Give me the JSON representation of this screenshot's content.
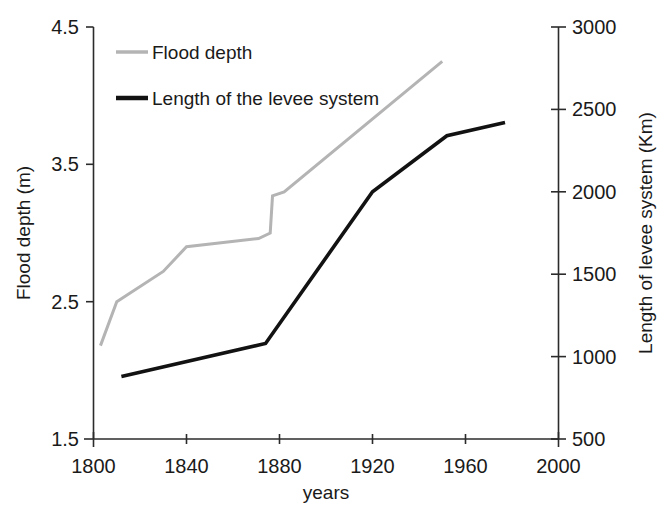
{
  "chart_data": {
    "type": "line",
    "title": "",
    "subtitle": "",
    "xlabel": "years",
    "ylabel": "Flood depth (m)",
    "y2label": "Length of levee system (Km)",
    "grid": false,
    "legend_position": "top-left inside plot",
    "xlim": [
      1800,
      2000
    ],
    "ylim": [
      1.5,
      4.5
    ],
    "y2lim": [
      500,
      3000
    ],
    "xticks": [
      "1800",
      "1840",
      "1880",
      "1920",
      "1960",
      "2000"
    ],
    "xtick_values": [
      1800,
      1840,
      1880,
      1920,
      1960,
      2000
    ],
    "yticks": [
      "1.5",
      "2.5",
      "3.5",
      "4.5"
    ],
    "ytick_values": [
      1.5,
      2.5,
      3.5,
      4.5
    ],
    "y2ticks": [
      "500",
      "1000",
      "1500",
      "2000",
      "2500",
      "3000"
    ],
    "y2tick_values": [
      500,
      1000,
      1500,
      2000,
      2500,
      3000
    ],
    "series": [
      {
        "name": "Flood depth",
        "axis": "left",
        "unit": "m",
        "color": "#b4b4b4",
        "stroke_width": 3,
        "x": [
          1803,
          1810,
          1830,
          1840,
          1871,
          1876,
          1877,
          1882,
          1950
        ],
        "values": [
          2.18,
          2.5,
          2.72,
          2.9,
          2.96,
          3.0,
          3.27,
          3.3,
          4.25
        ]
      },
      {
        "name": "Length of the levee system",
        "axis": "right",
        "unit": "Km",
        "color": "#121212",
        "stroke_width": 3.6,
        "x": [
          1812,
          1874,
          1920,
          1952,
          1977
        ],
        "values": [
          880,
          1080,
          2000,
          2340,
          2420
        ]
      }
    ]
  },
  "legend": {
    "entries": [
      {
        "label": "Flood depth",
        "color": "#b4b4b4"
      },
      {
        "label": "Length of the levee system",
        "color": "#121212"
      }
    ]
  },
  "axes": {
    "left": {
      "title": "Flood depth (m)",
      "labels": [
        "4.5",
        "3.5",
        "2.5",
        "1.5"
      ]
    },
    "right": {
      "title": "Length of levee system (Km)",
      "labels": [
        "3000",
        "2500",
        "2000",
        "1500",
        "1000",
        "500"
      ]
    },
    "bottom": {
      "title": "years",
      "labels": [
        "1800",
        "1840",
        "1880",
        "1920",
        "1960",
        "2000"
      ]
    }
  }
}
